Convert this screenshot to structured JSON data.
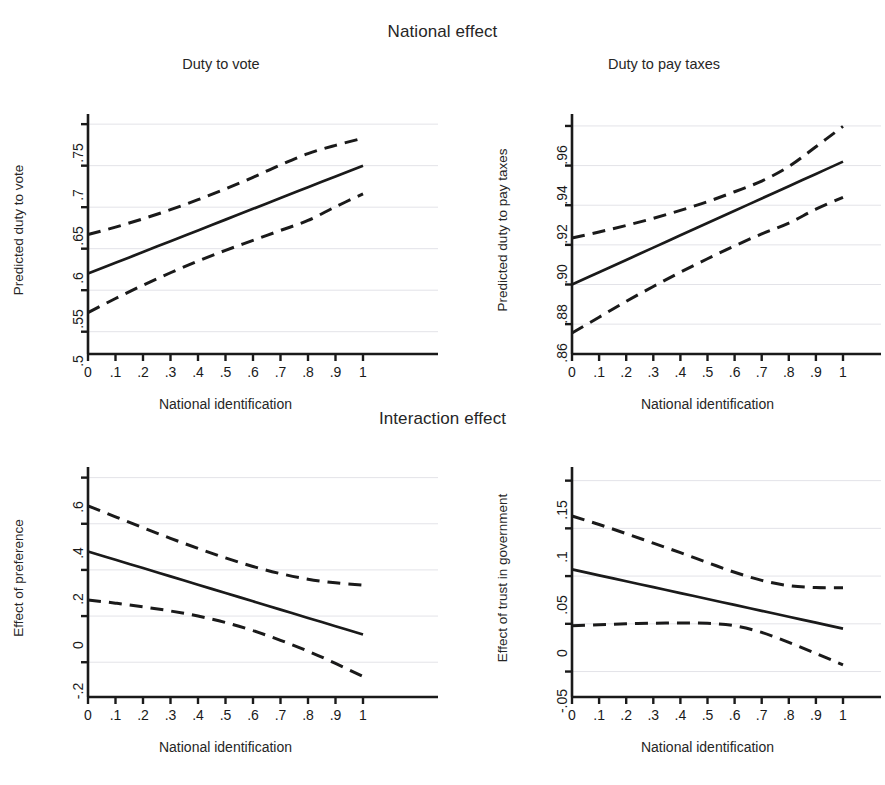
{
  "figure": {
    "group_titles": {
      "national": "National effect",
      "interaction": "Interaction effect"
    },
    "shared": {
      "xlabel": "National identification",
      "xticks": [
        "0",
        ".1",
        ".2",
        ".3",
        ".4",
        ".5",
        ".6",
        ".7",
        ".8",
        ".9",
        "1"
      ],
      "line_color": "#1a1a1a",
      "grid_color": "#e3e3e8",
      "background": "#ffffff"
    }
  },
  "chart_data": [
    {
      "id": "duty-to-vote",
      "type": "line",
      "title": "Duty to vote",
      "xlabel": "National identification",
      "ylabel": "Predicted duty to vote",
      "xlim": [
        0,
        1
      ],
      "ylim": [
        0.49,
        0.755
      ],
      "xticks": [
        0,
        0.1,
        0.2,
        0.3,
        0.4,
        0.5,
        0.6,
        0.7,
        0.8,
        0.9,
        1
      ],
      "yticks": [
        0.5,
        0.55,
        0.6,
        0.65,
        0.7,
        0.75
      ],
      "ytick_labels": [
        ".5",
        ".55",
        ".6",
        ".65",
        ".7",
        ".75"
      ],
      "grid": "horizontal",
      "legend": "none",
      "x": [
        0,
        0.1,
        0.2,
        0.3,
        0.4,
        0.5,
        0.6,
        0.7,
        0.8,
        0.9,
        1
      ],
      "series": [
        {
          "name": "Predicted",
          "style": "solid",
          "values": [
            0.57,
            0.583,
            0.596,
            0.609,
            0.622,
            0.635,
            0.648,
            0.661,
            0.674,
            0.687,
            0.7
          ]
        },
        {
          "name": "Upper 95% CI",
          "style": "dashed",
          "values": [
            0.617,
            0.626,
            0.636,
            0.647,
            0.659,
            0.672,
            0.686,
            0.701,
            0.7145,
            0.7245,
            0.733
          ]
        },
        {
          "name": "Lower 95% CI",
          "style": "dashed",
          "values": [
            0.523,
            0.54,
            0.556,
            0.571,
            0.585,
            0.598,
            0.61,
            0.622,
            0.634,
            0.6505,
            0.666
          ]
        }
      ]
    },
    {
      "id": "duty-to-pay-taxes",
      "type": "line",
      "title": "Duty to pay taxes",
      "xlabel": "National identification",
      "ylabel": "Predicted duty to pay taxes",
      "xlim": [
        0,
        1
      ],
      "ylim": [
        0.852,
        0.963
      ],
      "xticks": [
        0,
        0.1,
        0.2,
        0.3,
        0.4,
        0.5,
        0.6,
        0.7,
        0.8,
        0.9,
        1
      ],
      "yticks": [
        0.86,
        0.88,
        0.9,
        0.92,
        0.94,
        0.96
      ],
      "ytick_labels": [
        ".86",
        ".88",
        ".90",
        ".92",
        ".94",
        ".96"
      ],
      "grid": "horizontal",
      "legend": "none",
      "x": [
        0,
        0.1,
        0.2,
        0.3,
        0.4,
        0.5,
        0.6,
        0.7,
        0.8,
        0.9,
        1
      ],
      "series": [
        {
          "name": "Predicted",
          "style": "solid",
          "values": [
            0.88,
            0.8862,
            0.8924,
            0.8986,
            0.9048,
            0.911,
            0.9172,
            0.9234,
            0.9296,
            0.9358,
            0.942
          ]
        },
        {
          "name": "Upper 95% CI",
          "style": "dashed",
          "values": [
            0.9035,
            0.9065,
            0.9098,
            0.9134,
            0.9174,
            0.9218,
            0.9268,
            0.9322,
            0.9395,
            0.9495,
            0.9598
          ]
        },
        {
          "name": "Lower 95% CI",
          "style": "dashed",
          "values": [
            0.8555,
            0.8635,
            0.8715,
            0.879,
            0.8862,
            0.893,
            0.8995,
            0.9055,
            0.911,
            0.918,
            0.924
          ]
        }
      ]
    },
    {
      "id": "effect-of-preference",
      "type": "line",
      "title": "",
      "xlabel": "National identification",
      "ylabel": "Effect of preference",
      "xlim": [
        0,
        1
      ],
      "ylim": [
        -0.29,
        0.62
      ],
      "xticks": [
        0,
        0.1,
        0.2,
        0.3,
        0.4,
        0.5,
        0.6,
        0.7,
        0.8,
        0.9,
        1
      ],
      "yticks": [
        -0.2,
        0,
        0.2,
        0.4,
        0.6
      ],
      "ytick_labels": [
        "-.2",
        "0",
        ".2",
        ".4",
        ".6"
      ],
      "grid": "horizontal",
      "legend": "none",
      "x": [
        0,
        0.1,
        0.2,
        0.3,
        0.4,
        0.5,
        0.6,
        0.7,
        0.8,
        0.9,
        1
      ],
      "series": [
        {
          "name": "Effect",
          "style": "solid",
          "values": [
            0.28,
            0.244,
            0.208,
            0.172,
            0.136,
            0.1,
            0.064,
            0.028,
            -0.008,
            -0.044,
            -0.08
          ]
        },
        {
          "name": "Upper 95% CI",
          "style": "dashed",
          "values": [
            0.478,
            0.43,
            0.383,
            0.337,
            0.293,
            0.252,
            0.215,
            0.184,
            0.16,
            0.144,
            0.134
          ]
        },
        {
          "name": "Lower 95% CI",
          "style": "dashed",
          "values": [
            0.07,
            0.056,
            0.04,
            0.022,
            0.0,
            -0.028,
            -0.063,
            -0.105,
            -0.152,
            -0.205,
            -0.262
          ]
        }
      ]
    },
    {
      "id": "effect-of-trust-in-government",
      "type": "line",
      "title": "",
      "xlabel": "National identification",
      "ylabel": "Effect of trust in government",
      "xlim": [
        0,
        1
      ],
      "ylim": [
        -0.062,
        0.158
      ],
      "xticks": [
        0,
        0.1,
        0.2,
        0.3,
        0.4,
        0.5,
        0.6,
        0.7,
        0.8,
        0.9,
        1
      ],
      "yticks": [
        -0.05,
        0,
        0.05,
        0.1,
        0.15
      ],
      "ytick_labels": [
        "-.05",
        "0",
        ".05",
        ".1",
        ".15"
      ],
      "grid": "horizontal",
      "legend": "none",
      "x": [
        0,
        0.1,
        0.2,
        0.3,
        0.4,
        0.5,
        0.6,
        0.7,
        0.8,
        0.9,
        1
      ],
      "series": [
        {
          "name": "Effect",
          "style": "solid",
          "values": [
            0.057,
            0.0508,
            0.0446,
            0.0384,
            0.0322,
            0.026,
            0.0198,
            0.0136,
            0.0074,
            0.0012,
            -0.005
          ]
        },
        {
          "name": "Upper 95% CI",
          "style": "dashed",
          "values": [
            0.113,
            0.104,
            0.0945,
            0.0845,
            0.0745,
            0.0642,
            0.054,
            0.0455,
            0.04,
            0.038,
            0.0378
          ]
        },
        {
          "name": "Lower 95% CI",
          "style": "dashed",
          "values": [
            -0.002,
            -0.001,
            0.0,
            0.0006,
            0.0008,
            0.0005,
            -0.002,
            -0.009,
            -0.0195,
            -0.031,
            -0.043
          ]
        }
      ]
    }
  ]
}
